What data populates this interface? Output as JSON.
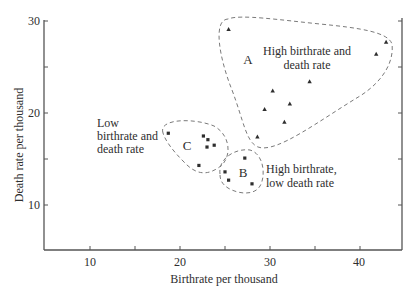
{
  "chart_data": {
    "type": "scatter",
    "title": "",
    "xlabel": "Birthrate per thousand",
    "ylabel": "Death rate per thousand",
    "xlim": [
      5,
      44.7
    ],
    "ylim": [
      5,
      30.3
    ],
    "xticks": [
      10,
      20,
      30,
      40
    ],
    "yticks": [
      10,
      20,
      30
    ],
    "grid": false,
    "legend": null,
    "series": [
      {
        "name": "C: Low birthrate and death rate",
        "marker": "circle",
        "points": [
          {
            "x": 18.7,
            "y": 17.8
          },
          {
            "x": 22.6,
            "y": 17.5
          },
          {
            "x": 23.1,
            "y": 17.1
          },
          {
            "x": 23.0,
            "y": 16.3
          },
          {
            "x": 23.8,
            "y": 16.5
          },
          {
            "x": 22.1,
            "y": 14.3
          }
        ]
      },
      {
        "name": "B: High birthrate, low death rate",
        "marker": "circle",
        "points": [
          {
            "x": 27.2,
            "y": 15.1
          },
          {
            "x": 25.0,
            "y": 13.6
          },
          {
            "x": 25.4,
            "y": 12.7
          },
          {
            "x": 28.0,
            "y": 12.3
          }
        ]
      },
      {
        "name": "A: High birthrate and death rate",
        "marker": "triangle",
        "points": [
          {
            "x": 25.4,
            "y": 29.1
          },
          {
            "x": 42.9,
            "y": 27.7
          },
          {
            "x": 41.8,
            "y": 26.4
          },
          {
            "x": 34.4,
            "y": 23.4
          },
          {
            "x": 30.3,
            "y": 22.4
          },
          {
            "x": 32.2,
            "y": 21.0
          },
          {
            "x": 29.4,
            "y": 20.4
          },
          {
            "x": 31.6,
            "y": 19.0
          },
          {
            "x": 28.6,
            "y": 17.4
          }
        ]
      }
    ],
    "annotations": [
      {
        "id": "A",
        "letter": "A",
        "lines": [
          "High birthrate and",
          "death rate"
        ]
      },
      {
        "id": "B",
        "letter": "B",
        "lines": [
          "High birthrate,",
          "low death rate"
        ]
      },
      {
        "id": "C",
        "letter": "C",
        "lines": [
          "Low",
          "birthrate and",
          "death rate"
        ]
      }
    ]
  },
  "labels": {
    "xlabel": "Birthrate per thousand",
    "ylabel": "Death rate per thousand",
    "xticks": [
      "10",
      "20",
      "30",
      "40"
    ],
    "yticks": [
      "10",
      "20",
      "30"
    ],
    "region_a": {
      "letter": "A",
      "line1": "High birthrate and",
      "line2": "death rate"
    },
    "region_b": {
      "letter": "B",
      "line1": "High birthrate,",
      "line2": "low death rate"
    },
    "region_c": {
      "letter": "C",
      "line1": "Low",
      "line2": "birthrate and",
      "line3": "death rate"
    }
  },
  "colors": {
    "ink": "#2e2e2e",
    "axis": "#555555",
    "dash": "#7a7a7a",
    "background": "#ffffff"
  }
}
